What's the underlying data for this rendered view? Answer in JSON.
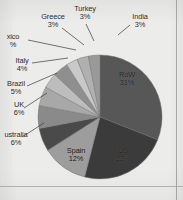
{
  "figure": {
    "kind": "scanned-pie-chart",
    "background_color": "#ececea",
    "frame_color": "#9a9a99"
  },
  "chart_data": {
    "type": "pie",
    "title": "",
    "xlabel": "",
    "ylabel": "",
    "legend_position": "none",
    "labels_inside": [
      "RoW",
      "US",
      "Spain"
    ],
    "start_angle_deg": 0,
    "direction": "clockwise",
    "categories": [
      "RoW",
      "US",
      "Spain",
      "Australia",
      "UK",
      "Brazil",
      "Italy",
      "Mexico",
      "Greece",
      "Turkey",
      "India"
    ],
    "values": [
      31,
      23,
      12,
      6,
      6,
      5,
      4,
      4,
      3,
      3,
      3
    ],
    "unit": "%",
    "slices": [
      {
        "name": "RoW",
        "percent": 31,
        "label": "RoW",
        "percent_label": "31%",
        "color": "#575757",
        "label_placement": "inside"
      },
      {
        "name": "US",
        "percent": 23,
        "label": "US",
        "percent_label": "23%",
        "color": "#3b3b3b",
        "label_placement": "inside"
      },
      {
        "name": "Spain",
        "percent": 12,
        "label": "Spain",
        "percent_label": "12%",
        "color": "#9d9d9d",
        "label_placement": "inside"
      },
      {
        "name": "Australia",
        "percent": 6,
        "label": "ustralia",
        "percent_label": "6%",
        "color": "#4a4a4a",
        "label_placement": "outside-left"
      },
      {
        "name": "UK",
        "percent": 6,
        "label": "UK",
        "percent_label": "6%",
        "color": "#8a8a8a",
        "label_placement": "outside-left"
      },
      {
        "name": "Brazil",
        "percent": 5,
        "label": "Brazil",
        "percent_label": "5%",
        "color": "#a8a8a8",
        "label_placement": "outside-left"
      },
      {
        "name": "Italy",
        "percent": 4,
        "label": "Italy",
        "percent_label": "4%",
        "color": "#bdbdbd",
        "label_placement": "outside-left"
      },
      {
        "name": "Mexico",
        "percent": 4,
        "label": "xico",
        "percent_label": "%",
        "color": "#8f8f8f",
        "label_placement": "outside-left"
      },
      {
        "name": "Greece",
        "percent": 3,
        "label": "Greece",
        "percent_label": "3%",
        "color": "#c9c9c9",
        "label_placement": "outside-top"
      },
      {
        "name": "Turkey",
        "percent": 3,
        "label": "Turkey",
        "percent_label": "3%",
        "color": "#b0b0b0",
        "label_placement": "outside-top"
      },
      {
        "name": "India",
        "percent": 3,
        "label": "India",
        "percent_label": "3%",
        "color": "#9a9a9a",
        "label_placement": "outside-top-right"
      }
    ]
  }
}
